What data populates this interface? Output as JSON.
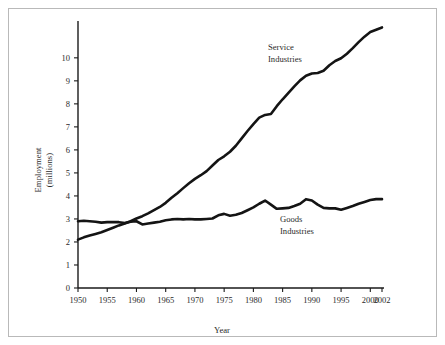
{
  "figure": {
    "background_color": "#ffffff",
    "border_color": "#b9b9b9",
    "line_color": "#141414",
    "text_color": "#2b2b2b"
  },
  "chart_data": {
    "type": "line",
    "title": "",
    "xlabel": "Year",
    "ylabel": "Employment\n(millions)",
    "ylabel_line1": "Employment",
    "ylabel_line2": "(millions)",
    "xlim": [
      1950,
      2002
    ],
    "ylim": [
      0,
      11.6
    ],
    "grid": false,
    "legend": "inline-annotations",
    "xticks": [
      1950,
      1955,
      1960,
      1965,
      1970,
      1975,
      1980,
      1985,
      1990,
      1995,
      2000,
      2002
    ],
    "xticklabels": [
      "1950",
      "1955",
      "1960",
      "1965",
      "1970",
      "1975",
      "1980",
      "1985",
      "1990",
      "1995",
      "2000",
      "2002"
    ],
    "yticks": [
      0,
      1,
      2,
      3,
      4,
      5,
      6,
      7,
      8,
      9,
      10
    ],
    "yticklabels": [
      "0",
      "1",
      "2",
      "3",
      "4",
      "5",
      "6",
      "7",
      "8",
      "9",
      "10"
    ],
    "annotations": [
      {
        "name": "service-industries-label",
        "line1": "Service",
        "line2": "Industries",
        "x": 1980,
        "y": 10.2
      },
      {
        "name": "goods-industries-label",
        "line1": "Goods",
        "line2": "Industries",
        "x": 1983,
        "y": 2.75
      }
    ],
    "x": [
      1950,
      1951,
      1952,
      1953,
      1954,
      1955,
      1956,
      1957,
      1958,
      1959,
      1960,
      1961,
      1962,
      1963,
      1964,
      1965,
      1966,
      1967,
      1968,
      1969,
      1970,
      1971,
      1972,
      1973,
      1974,
      1975,
      1976,
      1977,
      1978,
      1979,
      1980,
      1981,
      1982,
      1983,
      1984,
      1985,
      1986,
      1987,
      1988,
      1989,
      1990,
      1991,
      1992,
      1993,
      1994,
      1995,
      1996,
      1997,
      1998,
      1999,
      2000,
      2001,
      2002
    ],
    "series": [
      {
        "name": "Service Industries",
        "values": [
          2.1,
          2.2,
          2.28,
          2.35,
          2.42,
          2.52,
          2.62,
          2.72,
          2.8,
          2.9,
          3.02,
          3.12,
          3.24,
          3.38,
          3.52,
          3.7,
          3.92,
          4.12,
          4.34,
          4.55,
          4.74,
          4.9,
          5.08,
          5.32,
          5.56,
          5.72,
          5.92,
          6.18,
          6.5,
          6.82,
          7.12,
          7.4,
          7.52,
          7.56,
          7.9,
          8.2,
          8.48,
          8.76,
          9.02,
          9.22,
          9.32,
          9.34,
          9.44,
          9.68,
          9.86,
          9.98,
          10.18,
          10.42,
          10.68,
          10.92,
          11.12,
          11.22,
          11.32
        ]
      },
      {
        "name": "Goods Industries",
        "values": [
          2.9,
          2.92,
          2.9,
          2.88,
          2.84,
          2.86,
          2.87,
          2.86,
          2.82,
          2.88,
          2.9,
          2.76,
          2.8,
          2.84,
          2.88,
          2.94,
          2.98,
          3.0,
          2.98,
          3.0,
          2.98,
          2.98,
          3.0,
          3.02,
          3.16,
          3.22,
          3.14,
          3.18,
          3.26,
          3.38,
          3.5,
          3.66,
          3.8,
          3.62,
          3.44,
          3.46,
          3.48,
          3.56,
          3.66,
          3.86,
          3.8,
          3.62,
          3.48,
          3.46,
          3.46,
          3.4,
          3.48,
          3.56,
          3.66,
          3.74,
          3.82,
          3.86,
          3.86
        ]
      }
    ]
  }
}
